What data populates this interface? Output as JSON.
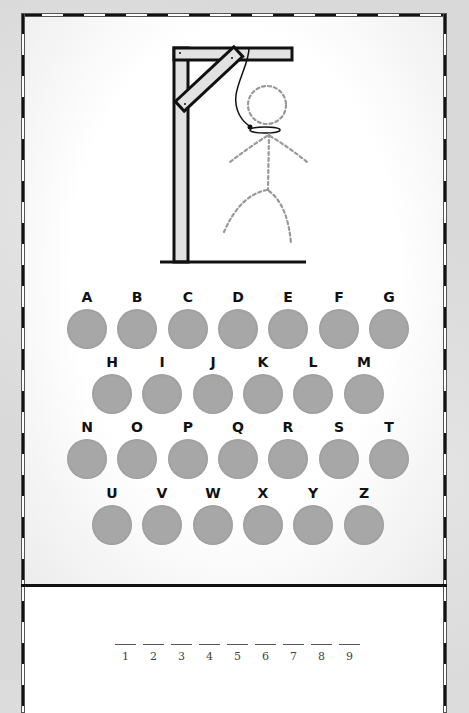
{
  "game": {
    "title": "Hangman",
    "wrong_guesses_drawn": [
      "head",
      "body",
      "left-arm",
      "right-arm",
      "left-leg",
      "right-leg"
    ]
  },
  "keyboard": {
    "rows": [
      [
        "A",
        "B",
        "C",
        "D",
        "E",
        "F",
        "G"
      ],
      [
        "H",
        "I",
        "J",
        "K",
        "L",
        "M"
      ],
      [
        "N",
        "O",
        "P",
        "Q",
        "R",
        "S",
        "T"
      ],
      [
        "U",
        "V",
        "W",
        "X",
        "Y",
        "Z"
      ]
    ],
    "disc_color": "#a7a7a7"
  },
  "word": {
    "length": 9,
    "slots": [
      {
        "index": "1",
        "letter": ""
      },
      {
        "index": "2",
        "letter": ""
      },
      {
        "index": "3",
        "letter": ""
      },
      {
        "index": "4",
        "letter": ""
      },
      {
        "index": "5",
        "letter": ""
      },
      {
        "index": "6",
        "letter": ""
      },
      {
        "index": "7",
        "letter": ""
      },
      {
        "index": "8",
        "letter": ""
      },
      {
        "index": "9",
        "letter": ""
      }
    ]
  }
}
